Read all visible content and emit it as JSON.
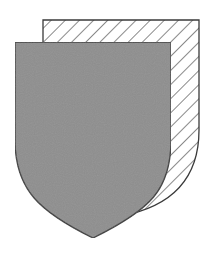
{
  "figure": {
    "colors": {
      "background": "#ffffff",
      "front_fill": "#8e8e8e",
      "outline": "#3a3a3a",
      "hatch": "#3a3a3a"
    },
    "back_shield": {
      "style": "diagonal-hatch",
      "offset_x": 28,
      "offset_y": -22
    },
    "front_shield": {
      "style": "solid-gray"
    }
  }
}
